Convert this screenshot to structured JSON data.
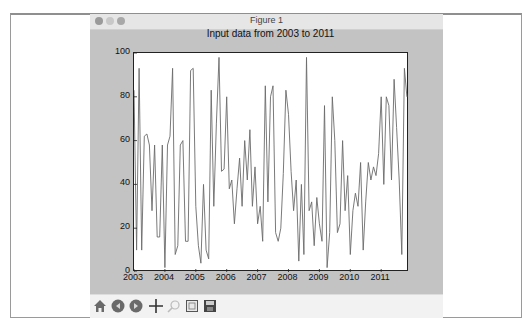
{
  "window": {
    "title": "Figure 1",
    "traffic_lights": [
      "close",
      "minimize",
      "zoom"
    ]
  },
  "toolbar": {
    "buttons": [
      {
        "name": "home",
        "icon": "home-icon",
        "enabled": true
      },
      {
        "name": "back",
        "icon": "back-arrow-icon",
        "enabled": true
      },
      {
        "name": "forward",
        "icon": "forward-arrow-icon",
        "enabled": true
      },
      {
        "name": "pan",
        "icon": "pan-cross-icon",
        "enabled": true
      },
      {
        "name": "zoom",
        "icon": "zoom-rect-icon",
        "enabled": false
      },
      {
        "name": "subplots",
        "icon": "subplots-config-icon",
        "enabled": true
      },
      {
        "name": "save",
        "icon": "save-disk-icon",
        "enabled": true
      }
    ]
  },
  "colors": {
    "figure_bg": "#c3c3c3",
    "axes_bg": "#ffffff",
    "line": "#6b6b6b"
  },
  "chart_data": {
    "type": "line",
    "title": "Input data from 2003 to 2011",
    "xlabel": "",
    "ylabel": "",
    "xlim": [
      2003,
      2011.9
    ],
    "ylim": [
      0,
      100
    ],
    "x_ticks": [
      "2003",
      "2004",
      "2005",
      "2006",
      "2007",
      "2008",
      "2009",
      "2010",
      "2011"
    ],
    "y_ticks": [
      "0",
      "20",
      "40",
      "60",
      "80",
      "100"
    ],
    "grid": false,
    "legend": null,
    "series": [
      {
        "name": "data",
        "frequency": "monthly",
        "start": "2003-01",
        "values": [
          83,
          10,
          93,
          10,
          62,
          63,
          58,
          28,
          58,
          16,
          16,
          58,
          2,
          58,
          62,
          93,
          8,
          12,
          58,
          60,
          14,
          14,
          92,
          93,
          30,
          12,
          4,
          40,
          10,
          6,
          83,
          30,
          68,
          98,
          46,
          47,
          80,
          38,
          42,
          22,
          38,
          52,
          30,
          60,
          42,
          65,
          30,
          48,
          22,
          30,
          14,
          85,
          32,
          80,
          85,
          18,
          14,
          20,
          45,
          83,
          72,
          46,
          28,
          42,
          5,
          40,
          8,
          98,
          28,
          32,
          12,
          34,
          22,
          14,
          76,
          2,
          18,
          80,
          60,
          18,
          22,
          60,
          28,
          44,
          8,
          28,
          36,
          30,
          50,
          10,
          32,
          50,
          42,
          48,
          44,
          54,
          80,
          40,
          80,
          76,
          42,
          88,
          66,
          42,
          8,
          93,
          80
        ]
      }
    ]
  }
}
